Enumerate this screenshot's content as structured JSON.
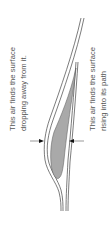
{
  "diagram": {
    "labels": {
      "upper_surface": {
        "line1": "This air finds the surface",
        "line2": "dropping away from it."
      },
      "lower_surface": {
        "line1": "This air finds the surface",
        "line2": "rising into its path"
      }
    },
    "colors": {
      "outline": "#444444",
      "fill": "#a9a9a9",
      "text": "#555555",
      "background": "#ffffff"
    }
  }
}
